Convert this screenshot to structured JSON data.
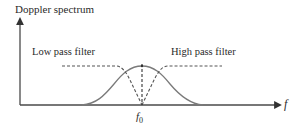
{
  "diagram": {
    "y_axis_label": "Doppler spectrum",
    "x_axis_label": "f",
    "center_label": "f",
    "center_subscript": "0",
    "low_pass_label": "Low pass filter",
    "high_pass_label": "High pass filter",
    "colors": {
      "curve": "#7a7a7a",
      "axis": "#4a4a4a",
      "dashed": "#555555",
      "text": "#2a2a2a"
    }
  }
}
